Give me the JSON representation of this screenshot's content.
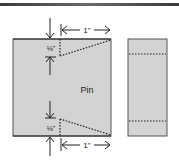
{
  "diagram": {
    "title_bar": true,
    "main_piece": {
      "label": "Pin",
      "fill": "#d3d3d3",
      "stroke": "#555555"
    },
    "side_piece": {
      "fill": "#d3d3d3",
      "stroke": "#555555"
    },
    "dimensions": {
      "top_width": "1\"",
      "bottom_width": "1\"",
      "top_depth": "⅛\"",
      "bottom_depth": "⅛\""
    },
    "colors": {
      "line": "#222222",
      "dotted": "#222222"
    }
  }
}
